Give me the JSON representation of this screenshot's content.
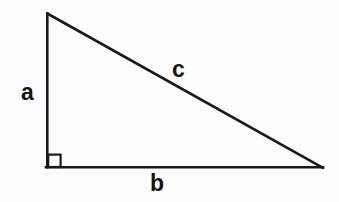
{
  "diagram": {
    "type": "right-triangle",
    "background_color": "#fdfdfd",
    "stroke_color": "#1a1a1a",
    "stroke_width": 2.6,
    "label_color": "#141414",
    "vertices": {
      "apex": {
        "x": 47,
        "y": 13
      },
      "right_angle": {
        "x": 47,
        "y": 168
      },
      "base_right": {
        "x": 323,
        "y": 168
      }
    },
    "right_angle_marker": {
      "name": "right-angle-square",
      "x": 47,
      "y": 154,
      "size": 13,
      "filled": false
    },
    "labels": {
      "a": "a",
      "b": "b",
      "c": "c"
    },
    "label_meanings": {
      "a": "vertical leg",
      "b": "horizontal leg (base)",
      "c": "hypotenuse"
    }
  }
}
